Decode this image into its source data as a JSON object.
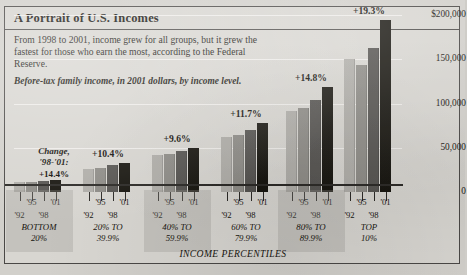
{
  "headline": "A Portrait of U.S. Incomes",
  "deck": "From 1998 to 2001, income grew for all groups, but it grew the fastest for those who earn the most, according to the Federal Reserve.",
  "subtitle": "Before-tax family income, in 2001 dollars, by income level.",
  "legend": {
    "line1": "Change,",
    "line2": "'98-'01:",
    "value": "+14.4%"
  },
  "xaxis_title": "INCOME PERCENTILES",
  "colors": {
    "paper": "#d8d6d1",
    "ink": "#17150f",
    "bar_1992": "#b9b7b2",
    "bar_1995": "#8e8c87",
    "bar_1998": "#565451",
    "bar_2001": "#17150f",
    "gridline": "#f2f0ec"
  },
  "chart_data": {
    "type": "bar",
    "title": "A Portrait of U.S. Incomes",
    "subtitle": "Before-tax family income, in 2001 dollars, by income level.",
    "xlabel": "INCOME PERCENTILES",
    "ylabel": "",
    "ylim": [
      0,
      200000
    ],
    "grid": true,
    "legend_position": "inline-year-labels",
    "ytick_labels": [
      "$200,000",
      "150,000",
      "100,000",
      "50,000",
      "0"
    ],
    "ytick_values": [
      200000,
      150000,
      100000,
      50000,
      0
    ],
    "categories": [
      "BOTTOM 20%",
      "20% TO 39.9%",
      "40% TO 59.9%",
      "60% TO 79.9%",
      "80% TO 89.9%",
      "TOP 10%"
    ],
    "category_lines": [
      [
        "BOTTOM",
        "20%"
      ],
      [
        "20% TO",
        "39.9%"
      ],
      [
        "40% TO",
        "59.9%"
      ],
      [
        "60% TO",
        "79.9%"
      ],
      [
        "80% TO",
        "89.9%"
      ],
      [
        "TOP",
        "10%"
      ]
    ],
    "year_labels": [
      "'92",
      "'95",
      "'98",
      "'01"
    ],
    "series": [
      {
        "name": "'92",
        "values": [
          11000,
          26000,
          42000,
          62000,
          92000,
          150000
        ]
      },
      {
        "name": "'95",
        "values": [
          11500,
          27000,
          43000,
          64000,
          95000,
          143000
        ]
      },
      {
        "name": "'98",
        "values": [
          12500,
          30000,
          46000,
          70000,
          104000,
          163000
        ]
      },
      {
        "name": "'01",
        "values": [
          14000,
          33000,
          50000,
          78000,
          119000,
          194000
        ]
      }
    ],
    "change_labels": [
      "+14.4%",
      "+10.4%",
      "+9.6%",
      "+11.7%",
      "+14.8%",
      "+19.3%"
    ],
    "annotation": "Change, '98-'01:"
  }
}
